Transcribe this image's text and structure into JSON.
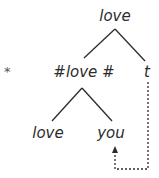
{
  "diagram": {
    "type": "syntax-tree",
    "ungrammatical_marker": "*",
    "nodes": {
      "root": "love",
      "left_child": "#love #",
      "right_child": "t",
      "left_grandchild": "love",
      "right_grandchild": "you"
    },
    "movement": {
      "from": "t",
      "to": "you",
      "style": "dotted-arrow"
    },
    "colors": {
      "text": "#2b2b2b",
      "background": "#ffffff"
    }
  }
}
